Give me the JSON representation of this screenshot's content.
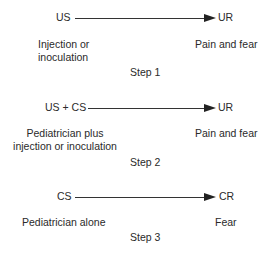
{
  "steps": [
    {
      "stimulus": "US",
      "response": "UR",
      "stimulus_desc": [
        "Injection or",
        "inoculation"
      ],
      "response_desc": "Pain and fear",
      "label": "Step 1"
    },
    {
      "stimulus": "US + CS",
      "response": "UR",
      "stimulus_desc": [
        "Pediatrician plus",
        "injection or inoculation"
      ],
      "response_desc": "Pain and fear",
      "label": "Step 2"
    },
    {
      "stimulus": "CS",
      "response": "CR",
      "stimulus_desc": [
        "Pediatrician alone"
      ],
      "response_desc": "Fear",
      "label": "Step 3"
    }
  ]
}
